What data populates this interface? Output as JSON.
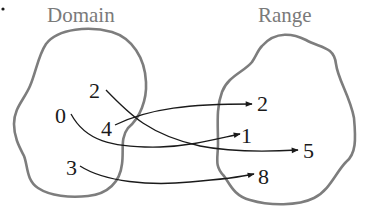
{
  "domain_title": "Domain",
  "range_title": "Range",
  "domain_elements": [
    "2",
    "0",
    "4",
    "3"
  ],
  "range_elements": [
    "2",
    "1",
    "5",
    "8"
  ],
  "mappings": [
    {
      "from": "2",
      "to": "5"
    },
    {
      "from": "4",
      "to": "2"
    },
    {
      "from": "0",
      "to": "1"
    },
    {
      "from": "3",
      "to": "8"
    }
  ],
  "colors": {
    "outline": "#7d7d7d",
    "title": "#7a7a7a",
    "ink": "#1a1a1a"
  }
}
